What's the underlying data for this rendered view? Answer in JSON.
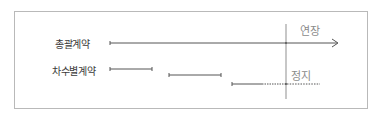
{
  "diagram": {
    "rows": [
      {
        "id": "master",
        "label": "총괄계약"
      },
      {
        "id": "per_order",
        "label": "차수별계약"
      }
    ],
    "annotations": {
      "extend": "연장",
      "stop": "정지"
    },
    "colors": {
      "line": "#555555",
      "border": "#b9b9b9",
      "text": "#3a3a3a",
      "annotation": "#8a8a8a"
    }
  }
}
